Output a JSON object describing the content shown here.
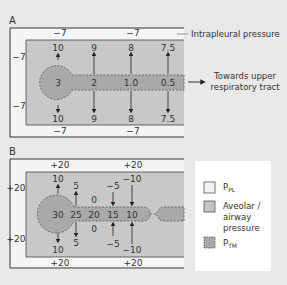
{
  "panels": {
    "A": {
      "label": "A",
      "intrapleural_label": "Intrapleural pressure",
      "outer_values": {
        "top_left": "−7",
        "top_right": "−7",
        "bottom_left": "−7",
        "bottom_right": "−7",
        "left_top": "−7",
        "left_bottom": "−7"
      },
      "airway_values": [
        "3",
        "2",
        "1.0",
        "0.5"
      ],
      "top_values": [
        "10",
        "9",
        "8",
        "7.5"
      ],
      "bottom_values": [
        "10",
        "9",
        "8",
        "7.5"
      ],
      "towards_line1": "Towards upper",
      "towards_line2": "respiratory tract"
    },
    "B": {
      "label": "B",
      "outer_values": {
        "top_left": "+20",
        "top_right": "+20",
        "bottom_left": "+20",
        "bottom_right": "+20",
        "left_top": "+20",
        "left_bottom": "+20"
      },
      "airway_values": [
        "30",
        "25",
        "20",
        "15",
        "10"
      ],
      "top_values": [
        "10",
        "5",
        "0",
        "−5",
        "−10"
      ],
      "bottom_values": [
        "10",
        "5",
        "0",
        "−5",
        "−10"
      ]
    }
  },
  "legend": {
    "items": [
      {
        "label": "P",
        "sub": "PL",
        "color": "#f4f4f4"
      },
      {
        "label": "Aveolar /",
        "label2": "airway",
        "label3": "pressure",
        "color": "#c4c4c4"
      },
      {
        "label": "P",
        "sub": "TM",
        "color": "#a8a8a8"
      }
    ]
  },
  "colors": {
    "background": "#e9e9e9",
    "pleural": "#f5f5f5",
    "alveolar": "#c8c8c8",
    "tm": "#a9a9a9",
    "line": "#333333"
  }
}
